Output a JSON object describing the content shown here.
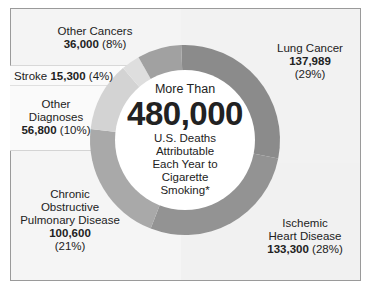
{
  "chart_data": {
    "type": "pie",
    "subtype": "donut",
    "title": "More Than 480,000 U.S. Deaths Attributable Each Year to Cigarette Smoking*",
    "center": {
      "pre": "More Than",
      "value": "480,000",
      "post_lines": [
        "U.S. Deaths",
        "Attributable",
        "Each Year to",
        "Cigarette",
        "Smoking*"
      ]
    },
    "categories": [
      "Lung Cancer",
      "Ischemic Heart Disease",
      "Chronic Obstructive Pulmonary Disease",
      "Other Diagnoses",
      "Stroke",
      "Other Cancers"
    ],
    "values": [
      137989,
      133300,
      100600,
      56800,
      15300,
      36000
    ],
    "percents": [
      29,
      28,
      21,
      10,
      4,
      8
    ],
    "colors": [
      "#8b8b8b",
      "#939393",
      "#a9a9a9",
      "#d3d3d3",
      "#dedede",
      "#a1a1a1"
    ],
    "legend_position": "callout panels"
  },
  "labels": {
    "other_cancers": {
      "lines": [
        "Other Cancers"
      ],
      "value": "36,000",
      "pct": "(8%)"
    },
    "stroke": {
      "name": "Stroke",
      "value": "15,300",
      "pct": "(4%)"
    },
    "other_diagnoses": {
      "lines": [
        "Other",
        "Diagnoses"
      ],
      "value": "56,800",
      "pct": "(10%)"
    },
    "copd": {
      "lines": [
        "Chronic",
        "Obstructive",
        "Pulmonary Disease"
      ],
      "value": "100,600",
      "pct": "(21%)"
    },
    "lung": {
      "lines": [
        "Lung Cancer"
      ],
      "value": "137,989",
      "pct": "(29%)"
    },
    "ischemic": {
      "lines": [
        "Ischemic",
        "Heart Disease"
      ],
      "value": "133,300",
      "pct": "(28%)"
    }
  },
  "colors": {
    "panel_bg": "#f4f4f4",
    "border": "#9a9a9a",
    "text": "#222222"
  }
}
